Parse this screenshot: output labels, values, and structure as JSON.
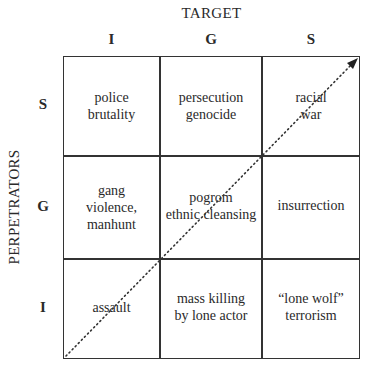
{
  "diagram": {
    "title": "TARGET",
    "y_axis_label": "PERPETRATORS",
    "columns": [
      "I",
      "G",
      "S"
    ],
    "rows": [
      "S",
      "G",
      "I"
    ],
    "cells": {
      "S_I": "police brutality",
      "S_G": "persecution genocide",
      "S_S": "racial war",
      "G_I": "gang violence, manhunt",
      "G_G": "pogrom ethnic cleansing",
      "G_S": "insurrection",
      "I_I": "assault",
      "I_G": "mass killing by lone actor",
      "I_S": "“lone wolf” terrorism"
    },
    "cell_lines": {
      "S_I": [
        "police",
        "brutality"
      ],
      "S_G": [
        "persecution",
        "genocide"
      ],
      "S_S": [
        "racial",
        "war"
      ],
      "G_I": [
        "gang",
        "violence,",
        "manhunt"
      ],
      "G_G": [
        "pogrom",
        "ethnic cleansing"
      ],
      "G_S": [
        "insurrection"
      ],
      "I_I": [
        "assault"
      ],
      "I_G": [
        "mass killing",
        "by lone actor"
      ],
      "I_S": [
        "“lone wolf”",
        "terrorism"
      ]
    },
    "arrow": {
      "style": "dotted",
      "direction": "bottom-left to top-right",
      "color": "#333333"
    }
  }
}
